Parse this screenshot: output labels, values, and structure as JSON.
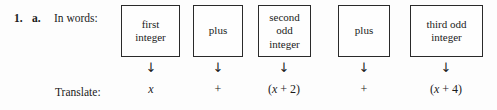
{
  "exercise": {
    "number": "1.",
    "part": "a.",
    "in_words_label": "In words:",
    "translate_label": "Translate:",
    "arrow_glyph": "↓",
    "border_color": "#2a2a2a",
    "text_color": "#1b1b1b",
    "background_color": "#fdfdfd"
  },
  "columns": [
    {
      "phrase": "first\ninteger",
      "arrow": "↓",
      "translation": "x",
      "translation_parts": [
        {
          "text": "x",
          "style": "italic"
        }
      ],
      "box": {
        "left": 121,
        "width": 59
      },
      "center": 151
    },
    {
      "phrase": "plus",
      "arrow": "↓",
      "translation": "+",
      "translation_parts": [
        {
          "text": "+",
          "style": "plain"
        }
      ],
      "box": {
        "left": 193,
        "width": 50
      },
      "center": 218
    },
    {
      "phrase": "second\nodd\ninteger",
      "arrow": "↓",
      "translation": "(x + 2)",
      "translation_parts": [
        {
          "text": "(",
          "style": "plain"
        },
        {
          "text": "x",
          "style": "italic"
        },
        {
          "text": " + 2)",
          "style": "plain"
        }
      ],
      "box": {
        "left": 258,
        "width": 53
      },
      "center": 284
    },
    {
      "phrase": "plus",
      "arrow": "↓",
      "translation": "+",
      "translation_parts": [
        {
          "text": "+",
          "style": "plain"
        }
      ],
      "box": {
        "left": 338,
        "width": 52
      },
      "center": 364
    },
    {
      "phrase": "third odd\ninteger",
      "arrow": "↓",
      "translation": "(x + 4)",
      "translation_parts": [
        {
          "text": "(",
          "style": "plain"
        },
        {
          "text": "x",
          "style": "italic"
        },
        {
          "text": " + 4)",
          "style": "plain"
        }
      ],
      "box": {
        "left": 410,
        "width": 73
      },
      "center": 446
    }
  ]
}
